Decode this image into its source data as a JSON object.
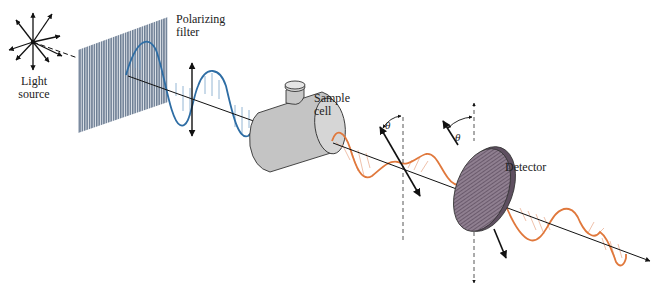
{
  "figure": {
    "type": "polarimeter-schematic",
    "labels": {
      "light_source_line1": "Light",
      "light_source_line2": "source",
      "polarizing_filter_line1": "Polarizing",
      "polarizing_filter_line2": "filter",
      "sample_cell_line1": "Sample",
      "sample_cell_line2": "cell",
      "detector": "Detector",
      "rotation_angle_1": "θ",
      "rotation_angle_2": "θ"
    },
    "components": [
      "Light source",
      "Polarizing filter",
      "Sample cell",
      "Detector"
    ],
    "colors": {
      "unpolarized_wave": "#2e6da4",
      "rotated_wave": "#e0783c",
      "filter": "#7f8ea3",
      "sample_cell": "#c4c4c4",
      "detector": "#8a7a8a",
      "axis": "#111111"
    }
  }
}
